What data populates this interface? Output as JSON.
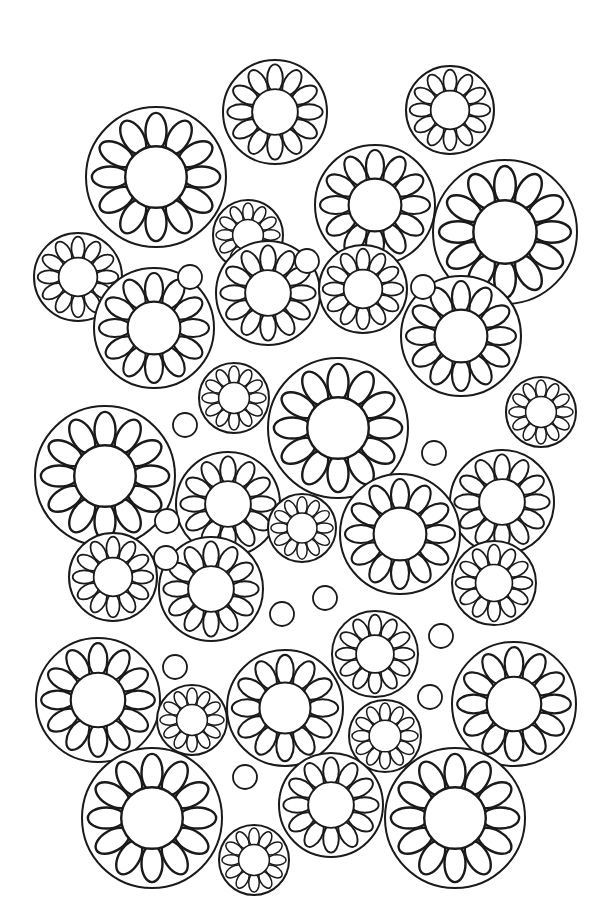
{
  "page": {
    "title": "Flower circles coloring page",
    "background_color": "#ffffff",
    "line_color": "#1a1a1a",
    "width": 605,
    "height": 910
  },
  "style": {
    "petal_count": 12,
    "ring_stroke": 2.0,
    "petal_stroke": 1.8,
    "center_ratio": 0.44,
    "petal_length_ratio": 0.34,
    "petal_width_ratio": 0.15
  },
  "flowers": [
    {
      "cx": 156,
      "cy": 177,
      "r": 70
    },
    {
      "cx": 275,
      "cy": 112,
      "r": 52
    },
    {
      "cx": 450,
      "cy": 110,
      "r": 44
    },
    {
      "cx": 375,
      "cy": 205,
      "r": 60
    },
    {
      "cx": 505,
      "cy": 232,
      "r": 72
    },
    {
      "cx": 248,
      "cy": 235,
      "r": 35
    },
    {
      "cx": 78,
      "cy": 277,
      "r": 44
    },
    {
      "cx": 154,
      "cy": 328,
      "r": 60
    },
    {
      "cx": 268,
      "cy": 293,
      "r": 52
    },
    {
      "cx": 363,
      "cy": 289,
      "r": 44
    },
    {
      "cx": 461,
      "cy": 336,
      "r": 60
    },
    {
      "cx": 234,
      "cy": 398,
      "r": 35
    },
    {
      "cx": 338,
      "cy": 428,
      "r": 70
    },
    {
      "cx": 541,
      "cy": 412,
      "r": 35
    },
    {
      "cx": 105,
      "cy": 476,
      "r": 70
    },
    {
      "cx": 228,
      "cy": 504,
      "r": 52
    },
    {
      "cx": 502,
      "cy": 502,
      "r": 52
    },
    {
      "cx": 302,
      "cy": 528,
      "r": 34
    },
    {
      "cx": 400,
      "cy": 534,
      "r": 60
    },
    {
      "cx": 113,
      "cy": 577,
      "r": 44
    },
    {
      "cx": 211,
      "cy": 589,
      "r": 52
    },
    {
      "cx": 494,
      "cy": 583,
      "r": 42
    },
    {
      "cx": 375,
      "cy": 654,
      "r": 43
    },
    {
      "cx": 98,
      "cy": 700,
      "r": 62
    },
    {
      "cx": 192,
      "cy": 720,
      "r": 35
    },
    {
      "cx": 285,
      "cy": 708,
      "r": 58
    },
    {
      "cx": 514,
      "cy": 704,
      "r": 62
    },
    {
      "cx": 385,
      "cy": 736,
      "r": 36
    },
    {
      "cx": 152,
      "cy": 818,
      "r": 70
    },
    {
      "cx": 254,
      "cy": 860,
      "r": 35
    },
    {
      "cx": 331,
      "cy": 805,
      "r": 52
    },
    {
      "cx": 455,
      "cy": 818,
      "r": 70
    }
  ],
  "dots": [
    {
      "cx": 190,
      "cy": 277,
      "r": 12
    },
    {
      "cx": 307,
      "cy": 261,
      "r": 12
    },
    {
      "cx": 423,
      "cy": 287,
      "r": 12
    },
    {
      "cx": 185,
      "cy": 425,
      "r": 12
    },
    {
      "cx": 434,
      "cy": 453,
      "r": 12
    },
    {
      "cx": 166,
      "cy": 558,
      "r": 12
    },
    {
      "cx": 167,
      "cy": 521,
      "r": 12
    },
    {
      "cx": 282,
      "cy": 614,
      "r": 12
    },
    {
      "cx": 325,
      "cy": 598,
      "r": 12
    },
    {
      "cx": 441,
      "cy": 636,
      "r": 12
    },
    {
      "cx": 175,
      "cy": 667,
      "r": 12
    },
    {
      "cx": 430,
      "cy": 697,
      "r": 12
    },
    {
      "cx": 245,
      "cy": 777,
      "r": 12
    }
  ]
}
